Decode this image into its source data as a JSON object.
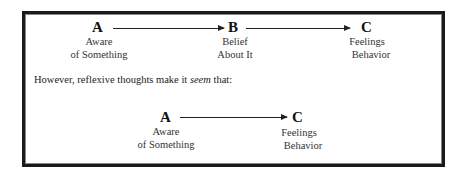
{
  "top_row": {
    "a": {
      "letter": "A",
      "line1": "Aware",
      "line2": "of Something"
    },
    "b": {
      "letter": "B",
      "line1": "Belief",
      "line2": "About It"
    },
    "c": {
      "letter": "C",
      "line1": "Feelings",
      "line2": "Behavior"
    }
  },
  "note": {
    "before": "However, reflexive thoughts make it ",
    "emphasis": "seem",
    "after": " that:"
  },
  "bottom_row": {
    "a": {
      "letter": "A",
      "line1": "Aware",
      "line2": "of Something"
    },
    "c": {
      "letter": "C",
      "line1": "Feelings",
      "line2": "Behavior"
    }
  }
}
